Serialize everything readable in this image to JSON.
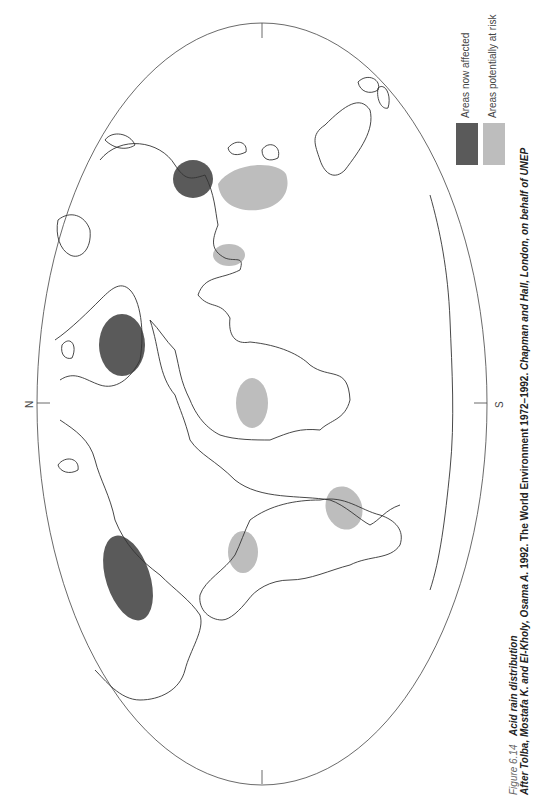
{
  "figure": {
    "number": "Figure 6.14",
    "title": "Acid rain distribution",
    "credit_parts": [
      {
        "text": "After Tolba, Mostafa K. and El-Kholy, Osama A.",
        "italic": true
      },
      {
        "text": " 1992. The World Environment 1972–1992. ",
        "italic": false
      },
      {
        "text": "Chapman and Hall, London, on behalf of UNEP",
        "italic": true
      }
    ]
  },
  "legend": {
    "items": [
      {
        "label": "Areas now affected",
        "color": "#5a5a5a"
      },
      {
        "label": "Areas potentially at risk",
        "color": "#bdbdbd"
      }
    ]
  },
  "map": {
    "projection": "elliptical world map (rotated 90°)",
    "pole_labels": {
      "north": "N",
      "south": "S"
    },
    "affected_regions": [
      "Western Europe / Scandinavia",
      "Eastern North America",
      "East Asia (China / Japan)"
    ],
    "at_risk_regions": [
      "South-east Asia",
      "India",
      "Central Africa",
      "Brazil",
      "Southern South America"
    ],
    "colors": {
      "affected": "#5a5a5a",
      "at_risk": "#bdbdbd",
      "outline": "#333333"
    }
  }
}
